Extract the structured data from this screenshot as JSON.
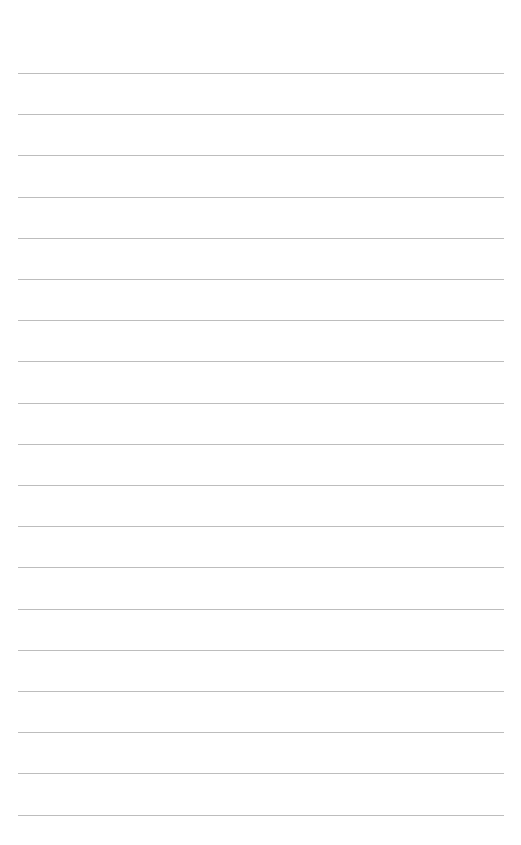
{
  "page": {
    "type": "lined-paper",
    "background_color": "#ffffff",
    "line_color": "#bdbdbd",
    "line_count": 19,
    "first_line_y": 73,
    "line_spacing": 41.2,
    "line_left": 18,
    "line_right": 504,
    "lines": [
      "",
      "",
      "",
      "",
      "",
      "",
      "",
      "",
      "",
      "",
      "",
      "",
      "",
      "",
      "",
      "",
      "",
      "",
      ""
    ]
  }
}
